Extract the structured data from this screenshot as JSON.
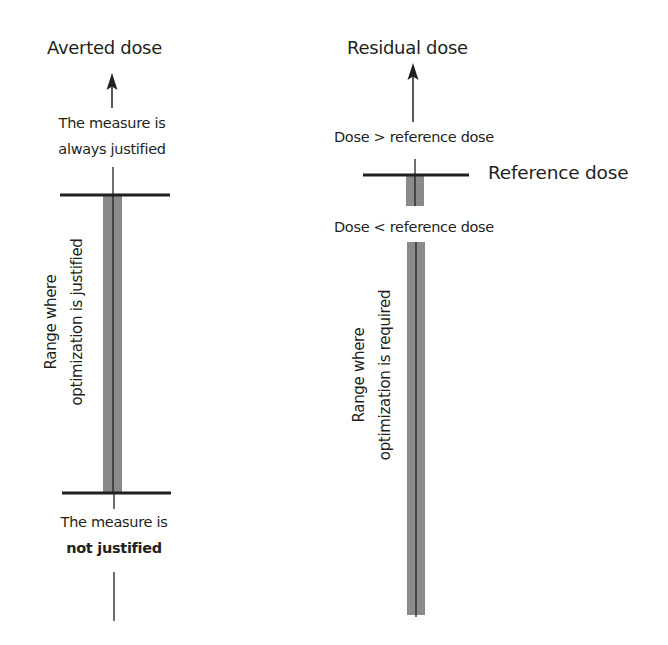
{
  "left_panel": {
    "title": "Averted dose",
    "top_note_line1": "The measure is",
    "top_note_line2": "always justified",
    "bottom_note_line1": "The measure is",
    "bottom_note_line2": "not justified",
    "range_label_line1": "Range where",
    "range_label_line2": "optimization is justified",
    "arrow_icon": "arrow-up-icon"
  },
  "right_panel": {
    "title": "Residual dose",
    "above_note": "Dose > reference dose",
    "reference_label": "Reference dose",
    "below_note": "Dose < reference dose",
    "range_label_line1": "Range where",
    "range_label_line2": "optimization is required",
    "arrow_icon": "arrow-up-icon"
  },
  "colors": {
    "line": "#231f20",
    "bar_fill": "#8a8a8a",
    "background": "#ffffff"
  }
}
